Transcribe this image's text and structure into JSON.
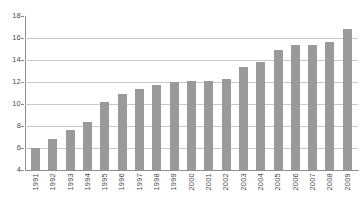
{
  "chart_data": {
    "type": "bar",
    "title": "",
    "subtitle": "",
    "xlabel": "",
    "ylabel": "",
    "categories": [
      "1991",
      "1992",
      "1993",
      "1994",
      "1995",
      "1996",
      "1997",
      "1998",
      "1999",
      "2000",
      "2001",
      "2002",
      "2003",
      "2004",
      "2005",
      "2006",
      "2007",
      "2008",
      "2009"
    ],
    "values": [
      6.0,
      6.8,
      7.6,
      8.4,
      10.2,
      10.9,
      11.4,
      11.7,
      12.0,
      12.1,
      12.1,
      12.3,
      13.4,
      13.8,
      14.9,
      15.4,
      15.4,
      15.6,
      16.8
    ],
    "series": [
      {
        "name": "",
        "values": [
          6.0,
          6.8,
          7.6,
          8.4,
          10.2,
          10.9,
          11.4,
          11.7,
          12.0,
          12.1,
          12.1,
          12.3,
          13.4,
          13.8,
          14.9,
          15.4,
          15.4,
          15.6,
          16.8
        ]
      }
    ],
    "ylim": [
      4,
      18
    ],
    "ytick_values": [
      4,
      6,
      8,
      10,
      12,
      14,
      16,
      18
    ],
    "ytick_labels": [
      "4",
      "6",
      "8",
      "10",
      "12",
      "14",
      "16",
      "18"
    ],
    "gridlines": [
      6,
      8,
      10,
      12,
      14,
      16
    ],
    "grid": true,
    "legend": false,
    "legend_position": "none",
    "bar_color": "#9a9a9a",
    "grid_color": "#c9c9c9",
    "axis_color": "#8f8f8f",
    "label_color": "#4a4a4a",
    "xtick_rotation": 90
  }
}
